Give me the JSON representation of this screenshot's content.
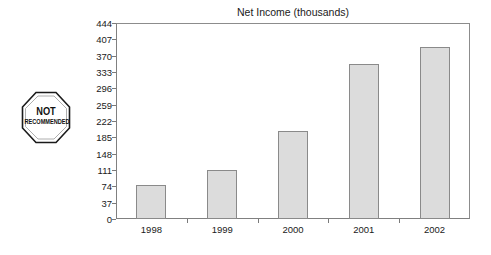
{
  "badge": {
    "shape": "octagon-stop-sign",
    "line1": "NOT",
    "line2": "RECOMMENDED"
  },
  "chart_data": {
    "type": "bar",
    "title": "Net Income (thousands)",
    "xlabel": "",
    "ylabel": "",
    "categories": [
      "1998",
      "1999",
      "2000",
      "2001",
      "2002"
    ],
    "values": [
      76,
      112,
      200,
      352,
      389
    ],
    "series": [
      {
        "name": "Net Income",
        "values": [
          76,
          112,
          200,
          352,
          389
        ]
      }
    ],
    "ylim": [
      0,
      444
    ],
    "yticks": [
      0,
      37,
      74,
      111,
      148,
      185,
      222,
      259,
      296,
      333,
      370,
      407,
      444
    ],
    "ytick_labels": [
      "0",
      "37",
      "74",
      "111",
      "148",
      "185",
      "222",
      "259",
      "296",
      "333",
      "370",
      "407",
      "444"
    ],
    "grid": false,
    "legend": false,
    "legend_position": "none",
    "bar_color": "#dcdcdc",
    "bar_border_color": "#8a8a8a",
    "axis_color": "#808080",
    "background": "#ffffff",
    "annotations": [
      "NOT RECOMMENDED"
    ]
  }
}
